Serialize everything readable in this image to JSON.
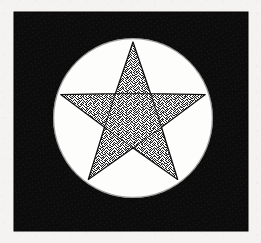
{
  "artwork": {
    "title": "Stippled five-pointed star in white disc on black square",
    "caption": "",
    "medium": "pen-and-ink stipple drawing",
    "colors": {
      "paper": "#f4f3f1",
      "square_fill": "#0d0c0c",
      "disc_fill": "#fdfdfc",
      "star_outline": "#100f0f",
      "stipple_dot": "#171616"
    },
    "canvas": {
      "width": 261,
      "height": 243
    },
    "square": {
      "x": 14,
      "y": 12,
      "width": 234,
      "height": 219
    },
    "disc": {
      "cx": 133,
      "cy": 118,
      "r": 80
    },
    "star": {
      "points": 5,
      "cx": 133,
      "cy": 118,
      "outer_radius": 76,
      "inner_radius": 30,
      "rotation_deg": -90,
      "fill_style": "stipple",
      "stipple_density_pct": 48,
      "tips": [
        {
          "name": "top",
          "x": 133,
          "y": 44
        },
        {
          "name": "right-arm",
          "x": 208,
          "y": 98
        },
        {
          "name": "bottom-right",
          "x": 180,
          "y": 188
        },
        {
          "name": "bottom-left",
          "x": 88,
          "y": 188
        },
        {
          "name": "left-arm",
          "x": 57,
          "y": 98
        }
      ],
      "inner_pentagon_visible": true
    }
  }
}
